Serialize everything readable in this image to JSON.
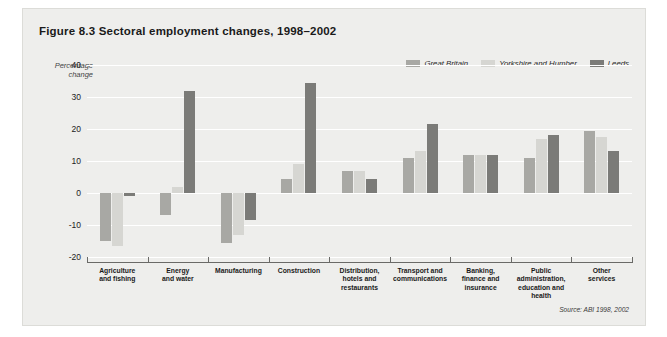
{
  "figure": {
    "title": "Figure 8.3  Sectoral employment changes, 1998–2002",
    "source": "Source: ABI 1998, 2002"
  },
  "legend": {
    "position": "top-right",
    "items": [
      {
        "label": "Great Britain",
        "color": "#a8a8a4",
        "key": "gb"
      },
      {
        "label": "Yorkshire and Humber",
        "color": "#d6d6d2",
        "key": "yh"
      },
      {
        "label": "Leeds",
        "color": "#7b7b78",
        "key": "leeds"
      }
    ]
  },
  "axis": {
    "y_label_line1": "Percentage",
    "y_label_line2": "change",
    "y_ticks": [
      "40",
      "30",
      "20",
      "10",
      "0",
      "-10",
      "-20"
    ]
  },
  "chart_data": {
    "type": "bar",
    "title": "Figure 8.3  Sectoral employment changes, 1998–2002",
    "xlabel": "",
    "ylabel": "Percentage change",
    "ylim": [
      -20,
      40
    ],
    "ytick_step": 10,
    "grid": true,
    "legend_position": "top-right",
    "categories": [
      "Agriculture and fishing",
      "Energy and water",
      "Manufacturing",
      "Construction",
      "Distribution, hotels and restaurants",
      "Transport and communications",
      "Banking, finance and insurance",
      "Public administration, education and health",
      "Other services"
    ],
    "category_label_lines": [
      [
        "Agriculture",
        "and fishing"
      ],
      [
        "Energy",
        "and water"
      ],
      [
        "Manufacturing"
      ],
      [
        "Construction"
      ],
      [
        "Distribution,",
        "hotels and",
        "restaurants"
      ],
      [
        "Transport and",
        "communications"
      ],
      [
        "Banking,",
        "finance and",
        "insurance"
      ],
      [
        "Public",
        "administration,",
        "education and",
        "health"
      ],
      [
        "Other",
        "services"
      ]
    ],
    "series": [
      {
        "name": "Great Britain",
        "color": "#a8a8a4",
        "values": [
          -15,
          -7,
          -15.5,
          4.5,
          7,
          11,
          12,
          11,
          19.5
        ]
      },
      {
        "name": "Yorkshire and Humber",
        "color": "#d6d6d2",
        "values": [
          -16.5,
          2,
          -13,
          9,
          7,
          13,
          12,
          17,
          17.5
        ]
      },
      {
        "name": "Leeds",
        "color": "#7b7b78",
        "values": [
          -1,
          32,
          -8.5,
          34.5,
          4.5,
          21.5,
          12,
          18,
          13
        ]
      }
    ]
  }
}
